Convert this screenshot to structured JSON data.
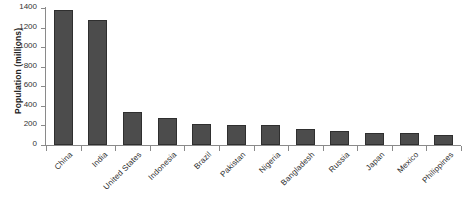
{
  "chart_data": {
    "type": "bar",
    "title": "",
    "subtitle": "",
    "xlabel": "",
    "ylabel": "Population (millions)",
    "categories": [
      "China",
      "India",
      "United States",
      "Indonesia",
      "Brazil",
      "Pakistan",
      "Nigeria",
      "Bangladesh",
      "Russia",
      "Japan",
      "Mexico",
      "Philippines"
    ],
    "values": [
      1380,
      1280,
      340,
      275,
      213,
      208,
      200,
      165,
      145,
      127,
      127,
      107
    ],
    "series": [
      {
        "name": "Population",
        "values": [
          1380,
          1280,
          340,
          275,
          213,
          208,
          200,
          165,
          145,
          127,
          127,
          107
        ]
      }
    ],
    "ylim": [
      0,
      1400
    ],
    "yticks": [
      0,
      200,
      400,
      600,
      800,
      1000,
      1200,
      1400
    ],
    "ytick_labels": [
      "0",
      "200",
      "400",
      "600",
      "800",
      "1000",
      "1200",
      "1400"
    ],
    "grid": false,
    "legend": false,
    "legend_position": "none",
    "bar_color": "#4c4c4c",
    "bar_edge_color": "#2f2f2f",
    "axis_color": "#8a8a8a",
    "background_color": "#ffffff",
    "xtick_label_rotation": -45
  }
}
